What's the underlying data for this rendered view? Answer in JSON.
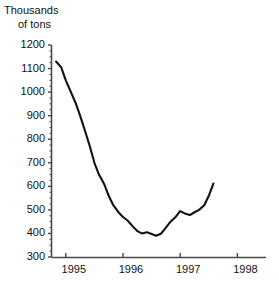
{
  "chart_data": {
    "type": "line",
    "title": "Thousands of tons",
    "title_line1": "Thousands",
    "title_line2": "of tons",
    "xlabel": "",
    "ylabel": "Thousands of tons",
    "ylim": [
      300,
      1200
    ],
    "ytick_labels": [
      "1200",
      "1100",
      "1000",
      "900",
      "800",
      "700",
      "600",
      "500",
      "400",
      "300"
    ],
    "ytick_values": [
      1200,
      1100,
      1000,
      900,
      800,
      700,
      600,
      500,
      400,
      300
    ],
    "xtick_labels": [
      "1995",
      "1996",
      "1997",
      "1998"
    ],
    "xtick_values": [
      1995,
      1996,
      1997,
      1998
    ],
    "xlim": [
      1994.75,
      1998.5
    ],
    "grid": false,
    "legend": null,
    "line_color": "#111111",
    "axis_color": "#4a4a4a",
    "series": [
      {
        "name": "Stocks",
        "x": [
          1994.83,
          1994.92,
          1995.0,
          1995.08,
          1995.17,
          1995.25,
          1995.33,
          1995.42,
          1995.5,
          1995.58,
          1995.67,
          1995.75,
          1995.83,
          1995.92,
          1996.0,
          1996.08,
          1996.17,
          1996.25,
          1996.33,
          1996.42,
          1996.5,
          1996.58,
          1996.67,
          1996.75,
          1996.83,
          1996.92,
          1997.0,
          1997.08,
          1997.17,
          1997.25,
          1997.33,
          1997.42,
          1997.5,
          1997.58
        ],
        "values": [
          1130,
          1105,
          1050,
          1005,
          955,
          900,
          840,
          770,
          700,
          650,
          610,
          560,
          520,
          490,
          470,
          455,
          430,
          410,
          400,
          405,
          398,
          390,
          400,
          425,
          450,
          470,
          495,
          485,
          478,
          490,
          500,
          520,
          560,
          612
        ]
      }
    ],
    "annotations": []
  }
}
